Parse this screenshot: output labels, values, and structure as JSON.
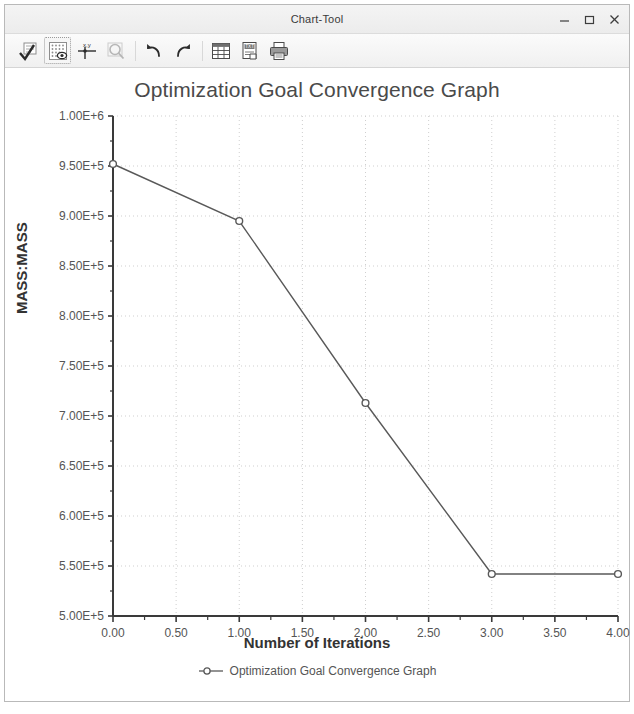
{
  "window": {
    "title": "Chart-Tool",
    "controls": [
      {
        "name": "minimize-button",
        "label": "–"
      },
      {
        "name": "maximize-button",
        "label": "□"
      },
      {
        "name": "close-button",
        "label": "✕"
      }
    ]
  },
  "toolbar": {
    "items": [
      {
        "name": "apply-check-icon",
        "tooltip": "Apply",
        "state": "normal"
      },
      {
        "name": "grid-point-icon",
        "tooltip": "Show Points",
        "state": "active"
      },
      {
        "name": "xy-axis-icon",
        "tooltip": "X,Y Axis",
        "state": "normal"
      },
      {
        "name": "zoom-icon",
        "tooltip": "Zoom",
        "state": "disabled"
      },
      {
        "name": "undo-icon",
        "tooltip": "Undo",
        "state": "normal"
      },
      {
        "name": "redo-icon",
        "tooltip": "Redo",
        "state": "normal"
      },
      {
        "name": "table-export-icon",
        "tooltip": "Export Table",
        "state": "normal"
      },
      {
        "name": "text-export-icon",
        "tooltip": "Export Text",
        "state": "normal"
      },
      {
        "name": "print-icon",
        "tooltip": "Print",
        "state": "normal"
      }
    ]
  },
  "colors": {
    "series": "#595959",
    "grid": "#cfcfcf",
    "axis": "#3a3a3a",
    "title_text": "#4a4a4a"
  },
  "chart_data": {
    "type": "line",
    "title": "Optimization Goal Convergence Graph",
    "xlabel": "Number of Iterations",
    "ylabel": "MASS:MASS",
    "grid": true,
    "legend_position": "bottom",
    "xlim": [
      0,
      4
    ],
    "ylim": [
      500000,
      1000000
    ],
    "xticks": [
      0,
      0.5,
      1,
      1.5,
      2,
      2.5,
      3,
      3.5,
      4
    ],
    "xticklabels": [
      "0.00",
      "0.50",
      "1.00",
      "1.50",
      "2.00",
      "2.50",
      "3.00",
      "3.50",
      "4.00"
    ],
    "yticks": [
      500000,
      550000,
      600000,
      650000,
      700000,
      750000,
      800000,
      850000,
      900000,
      950000,
      1000000
    ],
    "yticklabels": [
      "5.00E+5",
      "5.50E+5",
      "6.00E+5",
      "6.50E+5",
      "7.00E+5",
      "7.50E+5",
      "8.00E+5",
      "8.50E+5",
      "9.00E+5",
      "9.50E+5",
      "1.00E+6"
    ],
    "series": [
      {
        "name": "Optimization Goal Convergence Graph",
        "marker": "circle",
        "x": [
          0,
          1,
          2,
          3,
          4
        ],
        "values": [
          952000,
          895000,
          713000,
          542000,
          542000
        ]
      }
    ]
  }
}
